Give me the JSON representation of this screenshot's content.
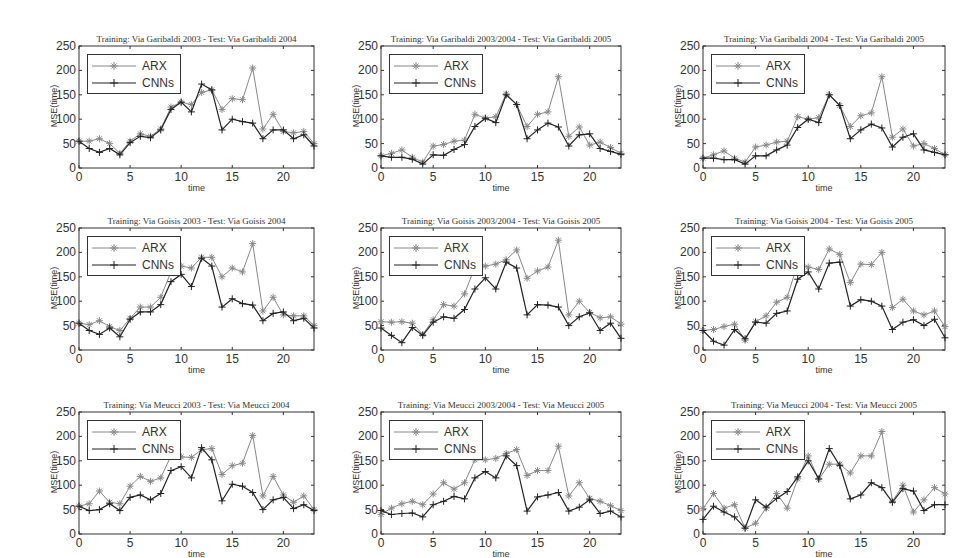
{
  "figure": {
    "xlabel": "time",
    "ylabel": "MSE(time)",
    "legend": [
      "ARX",
      "CNNs"
    ],
    "xticks": [
      0,
      5,
      10,
      15,
      20
    ],
    "yticks": [
      0,
      50,
      100,
      150,
      200,
      250
    ]
  },
  "chart_data": [
    {
      "type": "line",
      "title": "Training: Via Garibaldi 2003 - Test: Via Garibaldi 2004",
      "xlabel": "time",
      "ylabel": "MSE(time)",
      "xlim": [
        0,
        23
      ],
      "ylim": [
        0,
        250
      ],
      "x": [
        0,
        1,
        2,
        3,
        4,
        5,
        6,
        7,
        8,
        9,
        10,
        11,
        12,
        13,
        14,
        15,
        16,
        17,
        18,
        19,
        20,
        21,
        22,
        23
      ],
      "series": [
        {
          "name": "ARX",
          "values": [
            55,
            55,
            60,
            50,
            30,
            55,
            70,
            65,
            80,
            125,
            135,
            130,
            155,
            160,
            120,
            142,
            140,
            205,
            80,
            110,
            75,
            72,
            75,
            50
          ]
        },
        {
          "name": "CNNs",
          "values": [
            55,
            40,
            32,
            40,
            27,
            52,
            65,
            62,
            78,
            120,
            135,
            115,
            172,
            160,
            78,
            100,
            95,
            92,
            60,
            78,
            78,
            60,
            68,
            45
          ]
        }
      ]
    },
    {
      "type": "line",
      "title": "Training: Via Garibaldi 2003/2004 - Test: Via Garibaldi 2005",
      "xlabel": "time",
      "ylabel": "MSE(time)",
      "xlim": [
        0,
        23
      ],
      "ylim": [
        0,
        250
      ],
      "x": [
        0,
        1,
        2,
        3,
        4,
        5,
        6,
        7,
        8,
        9,
        10,
        11,
        12,
        13,
        14,
        15,
        16,
        17,
        18,
        19,
        20,
        21,
        22,
        23
      ],
      "series": [
        {
          "name": "ARX",
          "values": [
            25,
            30,
            37,
            22,
            12,
            45,
            48,
            55,
            57,
            110,
            102,
            105,
            152,
            130,
            85,
            110,
            115,
            187,
            65,
            84,
            47,
            53,
            42,
            30
          ]
        },
        {
          "name": "CNNs",
          "values": [
            25,
            22,
            22,
            18,
            8,
            27,
            26,
            38,
            48,
            85,
            102,
            93,
            150,
            130,
            60,
            78,
            92,
            84,
            45,
            68,
            70,
            40,
            34,
            28
          ]
        }
      ]
    },
    {
      "type": "line",
      "title": "Training: Via Garibaldi 2004 - Test: Via Garibaldi 2005",
      "xlabel": "time",
      "ylabel": "MSE(time)",
      "xlim": [
        0,
        23
      ],
      "ylim": [
        0,
        250
      ],
      "x": [
        0,
        1,
        2,
        3,
        4,
        5,
        6,
        7,
        8,
        9,
        10,
        11,
        12,
        13,
        14,
        15,
        16,
        17,
        18,
        19,
        20,
        21,
        22,
        23
      ],
      "series": [
        {
          "name": "ARX",
          "values": [
            20,
            27,
            35,
            20,
            12,
            43,
            47,
            53,
            55,
            105,
            100,
            103,
            150,
            128,
            85,
            107,
            113,
            187,
            63,
            80,
            45,
            50,
            40,
            27
          ]
        },
        {
          "name": "CNNs",
          "values": [
            20,
            20,
            17,
            17,
            8,
            25,
            25,
            37,
            47,
            83,
            100,
            93,
            150,
            128,
            60,
            78,
            90,
            82,
            43,
            63,
            70,
            37,
            32,
            27
          ]
        }
      ]
    },
    {
      "type": "line",
      "title": "Training: Via Goisis 2003 - Test: Via Goisis 2004",
      "xlabel": "time",
      "ylabel": "MSE(time)",
      "xlim": [
        0,
        23
      ],
      "ylim": [
        0,
        250
      ],
      "x": [
        0,
        1,
        2,
        3,
        4,
        5,
        6,
        7,
        8,
        9,
        10,
        11,
        12,
        13,
        14,
        15,
        16,
        17,
        18,
        19,
        20,
        21,
        22,
        23
      ],
      "series": [
        {
          "name": "ARX",
          "values": [
            55,
            52,
            60,
            48,
            40,
            65,
            88,
            88,
            108,
            160,
            172,
            168,
            190,
            190,
            150,
            168,
            160,
            218,
            80,
            108,
            72,
            70,
            70,
            50
          ]
        },
        {
          "name": "CNNs",
          "values": [
            55,
            40,
            32,
            45,
            27,
            63,
            78,
            78,
            93,
            140,
            155,
            130,
            188,
            172,
            88,
            105,
            95,
            92,
            60,
            75,
            78,
            60,
            65,
            45
          ]
        }
      ]
    },
    {
      "type": "line",
      "title": "Training: Via Goisis 2003/2004 - Test: Via Goisis 2005",
      "xlabel": "time",
      "ylabel": "MSE(time)",
      "xlim": [
        0,
        23
      ],
      "ylim": [
        0,
        250
      ],
      "x": [
        0,
        1,
        2,
        3,
        4,
        5,
        6,
        7,
        8,
        9,
        10,
        11,
        12,
        13,
        14,
        15,
        16,
        17,
        18,
        19,
        20,
        21,
        22,
        23
      ],
      "series": [
        {
          "name": "ARX",
          "values": [
            58,
            57,
            58,
            55,
            32,
            62,
            93,
            90,
            115,
            170,
            172,
            176,
            185,
            205,
            147,
            162,
            170,
            225,
            72,
            100,
            77,
            66,
            68,
            53
          ]
        },
        {
          "name": "CNNs",
          "values": [
            45,
            30,
            15,
            46,
            30,
            57,
            68,
            65,
            83,
            125,
            148,
            125,
            180,
            168,
            72,
            93,
            92,
            88,
            50,
            68,
            76,
            40,
            55,
            24
          ]
        }
      ]
    },
    {
      "type": "line",
      "title": "Training: Via Goisis 2004 - Test: Via Goisis 2005",
      "xlabel": "time",
      "ylabel": "MSE(time)",
      "xlim": [
        0,
        23
      ],
      "ylim": [
        0,
        250
      ],
      "x": [
        0,
        1,
        2,
        3,
        4,
        5,
        6,
        7,
        8,
        9,
        10,
        11,
        12,
        13,
        14,
        15,
        16,
        17,
        18,
        19,
        20,
        21,
        22,
        23
      ],
      "series": [
        {
          "name": "ARX",
          "values": [
            40,
            42,
            48,
            53,
            20,
            58,
            70,
            98,
            108,
            177,
            170,
            165,
            207,
            196,
            138,
            176,
            175,
            200,
            87,
            104,
            80,
            72,
            80,
            48
          ]
        },
        {
          "name": "CNNs",
          "values": [
            40,
            18,
            10,
            42,
            23,
            57,
            55,
            75,
            80,
            145,
            160,
            125,
            178,
            180,
            90,
            103,
            100,
            90,
            42,
            57,
            62,
            50,
            63,
            25
          ]
        }
      ]
    },
    {
      "type": "line",
      "title": "Training: Via Meucci 2003 - Test: Via Meucci 2004",
      "xlabel": "time",
      "ylabel": "MSE(time)",
      "xlim": [
        0,
        23
      ],
      "ylim": [
        0,
        250
      ],
      "x": [
        0,
        1,
        2,
        3,
        4,
        5,
        6,
        7,
        8,
        9,
        10,
        11,
        12,
        13,
        14,
        15,
        16,
        17,
        18,
        19,
        20,
        21,
        22,
        23
      ],
      "series": [
        {
          "name": "ARX",
          "values": [
            57,
            62,
            88,
            65,
            62,
            98,
            118,
            108,
            115,
            160,
            158,
            157,
            173,
            175,
            122,
            140,
            145,
            202,
            78,
            118,
            80,
            65,
            78,
            50
          ]
        },
        {
          "name": "CNNs",
          "values": [
            57,
            48,
            50,
            62,
            48,
            75,
            80,
            70,
            83,
            130,
            138,
            115,
            177,
            152,
            68,
            102,
            98,
            85,
            50,
            70,
            75,
            52,
            60,
            48
          ]
        }
      ]
    },
    {
      "type": "line",
      "title": "Training: Via Meucci 2003/2004 - Test: Via Meucci 2005",
      "xlabel": "time",
      "ylabel": "MSE(time)",
      "xlim": [
        0,
        23
      ],
      "ylim": [
        0,
        250
      ],
      "x": [
        0,
        1,
        2,
        3,
        4,
        5,
        6,
        7,
        8,
        9,
        10,
        11,
        12,
        13,
        14,
        15,
        16,
        17,
        18,
        19,
        20,
        21,
        22,
        23
      ],
      "series": [
        {
          "name": "ARX",
          "values": [
            40,
            53,
            62,
            67,
            60,
            82,
            105,
            92,
            105,
            152,
            152,
            155,
            165,
            173,
            120,
            130,
            130,
            180,
            78,
            105,
            73,
            67,
            58,
            48
          ]
        },
        {
          "name": "CNNs",
          "values": [
            48,
            40,
            42,
            43,
            35,
            60,
            67,
            77,
            72,
            115,
            128,
            115,
            160,
            140,
            47,
            76,
            80,
            85,
            47,
            55,
            70,
            42,
            47,
            35
          ]
        }
      ]
    },
    {
      "type": "line",
      "title": "Training: Via Meucci 2004 - Test: Via Meucci 2005",
      "xlabel": "time",
      "ylabel": "MSE(time)",
      "xlim": [
        0,
        23
      ],
      "ylim": [
        0,
        250
      ],
      "x": [
        0,
        1,
        2,
        3,
        4,
        5,
        6,
        7,
        8,
        9,
        10,
        11,
        12,
        13,
        14,
        15,
        16,
        17,
        18,
        19,
        20,
        21,
        22,
        23
      ],
      "series": [
        {
          "name": "ARX",
          "values": [
            52,
            83,
            53,
            60,
            12,
            22,
            53,
            83,
            53,
            113,
            160,
            112,
            143,
            143,
            125,
            160,
            160,
            210,
            67,
            100,
            45,
            70,
            95,
            82
          ]
        },
        {
          "name": "CNNs",
          "values": [
            30,
            57,
            45,
            35,
            12,
            70,
            55,
            73,
            87,
            117,
            150,
            113,
            175,
            140,
            72,
            80,
            105,
            95,
            65,
            93,
            88,
            48,
            60,
            60
          ]
        }
      ]
    }
  ]
}
